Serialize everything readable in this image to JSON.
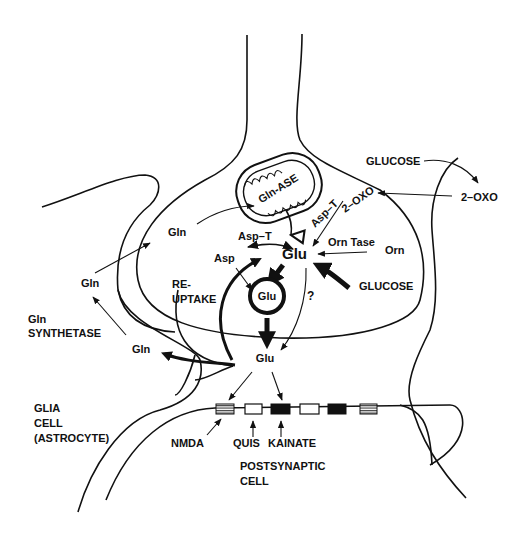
{
  "diagram": {
    "type": "glutamate synapse metabolism schematic",
    "colors": {
      "ink": "#111111",
      "background": "#ffffff"
    },
    "presynaptic": {
      "mitochondrion_label": "Gln-ASE",
      "glu_main": "Glu",
      "vesicle_glu": "Glu",
      "asp": "Asp",
      "asp_t_left": "Asp–T",
      "asp_t_right": "Asp–T",
      "two_oxo_inner": "2–OXO",
      "orn_tase": "Orn Tase",
      "orn": "Orn",
      "glucose_inner": "GLUCOSE",
      "gln_inner": "Gln",
      "reuptake_line1": "RE-",
      "reuptake_line2": "UPTAKE",
      "question": "?"
    },
    "cleft": {
      "glu_released": "Glu"
    },
    "glia": {
      "gln_top": "Gln",
      "gln_bottom": "Gln",
      "synthetase_line1": "Gln",
      "synthetase_line2": "SYNTHETASE",
      "cell_line1": "GLIA",
      "cell_line2": "CELL",
      "cell_line3": "(ASTROCYTE)"
    },
    "right_glia": {
      "glucose": "GLUCOSE",
      "two_oxo": "2–OXO"
    },
    "postsynaptic": {
      "receptors": [
        {
          "name": "NMDA",
          "style": "striped"
        },
        {
          "name": "QUIS",
          "style": "open"
        },
        {
          "name": "KAINATE",
          "style": "filled"
        },
        {
          "name": "",
          "style": "open"
        },
        {
          "name": "",
          "style": "filled"
        },
        {
          "name": "",
          "style": "striped"
        }
      ],
      "nmda": "NMDA",
      "quis": "QUIS",
      "kainate": "KAINATE",
      "cell_line1": "POSTSYNAPTIC",
      "cell_line2": "CELL"
    }
  }
}
